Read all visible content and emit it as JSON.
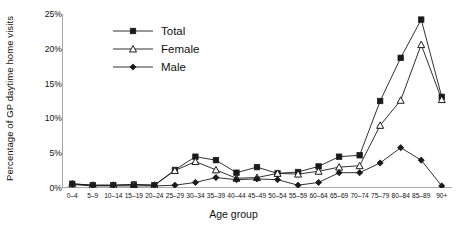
{
  "chart_data": {
    "type": "line",
    "title": "",
    "xlabel": "Age group",
    "ylabel": "Percentage of GP daytime home visits",
    "ylim": [
      0,
      25
    ],
    "yticks": [
      "0%",
      "5%",
      "10%",
      "15%",
      "20%",
      "25%"
    ],
    "ytick_values": [
      0,
      5,
      10,
      15,
      20,
      25
    ],
    "grid": false,
    "legend_position": "top-left-inside",
    "categories": [
      "0–4",
      "5–9",
      "10–14",
      "15–19",
      "20–24",
      "25–29",
      "30–34",
      "35–39",
      "40–44",
      "45–49",
      "50–54",
      "55–59",
      "60–64",
      "65–69",
      "70–74",
      "75–79",
      "80–84",
      "85–89",
      "90+"
    ],
    "series": [
      {
        "name": "Total",
        "marker": "filled-square",
        "color": "#1a1a1a",
        "values": [
          0.6,
          0.4,
          0.4,
          0.5,
          0.4,
          2.6,
          4.5,
          4.0,
          2.2,
          3.0,
          2.1,
          2.3,
          3.1,
          4.5,
          4.7,
          12.5,
          18.7,
          24.2,
          13.1
        ]
      },
      {
        "name": "Female",
        "marker": "open-triangle",
        "color": "#1a1a1a",
        "values": [
          0.6,
          0.4,
          0.4,
          0.5,
          0.4,
          2.5,
          3.8,
          2.6,
          1.4,
          1.5,
          2.1,
          2.0,
          2.4,
          3.0,
          3.2,
          9.0,
          12.6,
          20.6,
          12.7
        ]
      },
      {
        "name": "Male",
        "marker": "filled-diamond",
        "color": "#1a1a1a",
        "values": [
          0.5,
          0.3,
          0.3,
          0.3,
          0.3,
          0.4,
          0.8,
          1.5,
          1.2,
          1.3,
          1.2,
          0.4,
          0.8,
          2.2,
          2.2,
          3.6,
          5.8,
          4.0,
          0.3
        ]
      }
    ]
  },
  "legend": {
    "items": [
      {
        "label": "Total"
      },
      {
        "label": "Female"
      },
      {
        "label": "Male"
      }
    ]
  },
  "axes": {
    "x_title": "Age group",
    "y_title": "Percentage of GP daytime home visits"
  }
}
